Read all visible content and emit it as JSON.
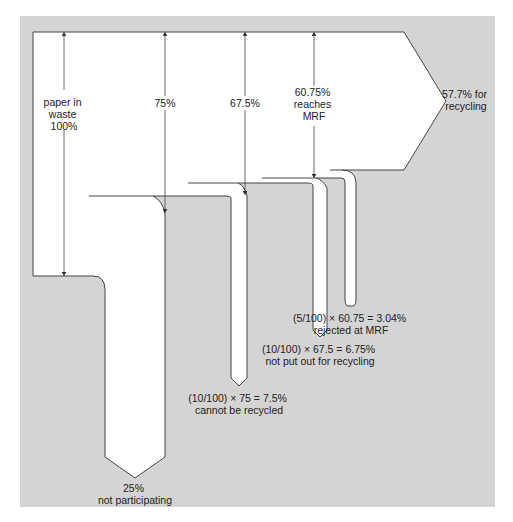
{
  "colors": {
    "panel": "#d4d4d4",
    "flow": "#ffffff",
    "outline": "#444444",
    "text": "#222222"
  },
  "main_flow": {
    "start_label": [
      "paper in",
      "waste",
      "100%"
    ],
    "stage_75": "75%",
    "stage_67_5": "67.5%",
    "stage_mrf": [
      "60.75%",
      "reaches",
      "MRF"
    ],
    "output": [
      "57.7% for",
      "recycling"
    ]
  },
  "losses": [
    {
      "label": [
        "25%",
        "not participating"
      ]
    },
    {
      "label": [
        "(10/100) × 75 = 7.5%",
        "cannot be recycled"
      ]
    },
    {
      "label": [
        "(10/100) × 67.5 = 6.75%",
        "not put out for recycling"
      ]
    },
    {
      "label": [
        "(5/100) × 60.75 = 3.04%",
        "rejected at MRF"
      ]
    }
  ]
}
